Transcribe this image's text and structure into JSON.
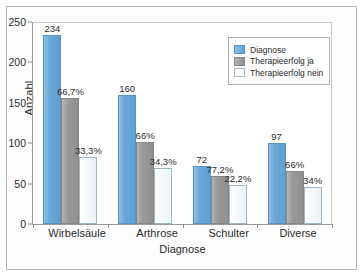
{
  "chart_data": {
    "type": "bar",
    "title": "",
    "xlabel": "Diagnose",
    "ylabel": "Anzahl",
    "ylim": [
      0,
      250
    ],
    "yticks": [
      0,
      50,
      100,
      150,
      200,
      250
    ],
    "grid": false,
    "legend_position": "top-right",
    "categories": [
      "Wirbelsäule",
      "Arthrose",
      "Schulter",
      "Diverse"
    ],
    "series": [
      {
        "name": "Diagnose",
        "color": "#6aa8d8",
        "values": [
          234,
          160,
          72,
          100
        ],
        "labels": [
          "234",
          "160",
          "72",
          "97"
        ]
      },
      {
        "name": "Therapieerfolg ja",
        "color": "#9a9a9a",
        "values": [
          156,
          101,
          59,
          66
        ],
        "labels": [
          "66,7%",
          "66%",
          "77,2%",
          "66%"
        ]
      },
      {
        "name": "Therapieerfolg nein",
        "color": "#ffffff",
        "values": [
          83,
          69,
          48,
          46
        ],
        "labels": [
          "33,3%",
          "34,3%",
          "22,2%",
          "34%"
        ]
      }
    ]
  },
  "legend": {
    "items": [
      {
        "label": "Diagnose"
      },
      {
        "label": "Therapieerfolg ja"
      },
      {
        "label": "Therapieerfolg nein"
      }
    ]
  }
}
